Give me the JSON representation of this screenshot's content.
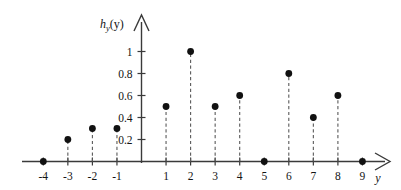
{
  "figure": {
    "title": "",
    "y_axis_label": "h",
    "y_axis_label_sub": "y",
    "y_axis_label_arg": "(y)",
    "x_axis_label": "y"
  },
  "chart_data": {
    "type": "stem",
    "title": "",
    "xlabel": "y",
    "ylabel": "h_y(y)",
    "x": [
      -4,
      -3,
      -2,
      -1,
      1,
      2,
      3,
      4,
      5,
      6,
      7,
      8,
      9
    ],
    "values": [
      0,
      0.2,
      0.3,
      0.3,
      0.5,
      1,
      0.5,
      0.6,
      0,
      0.8,
      0.4,
      0.6,
      0
    ],
    "points": [
      {
        "x": -4,
        "y": 0
      },
      {
        "x": -3,
        "y": 0.2
      },
      {
        "x": -2,
        "y": 0.3
      },
      {
        "x": -1,
        "y": 0.3
      },
      {
        "x": 1,
        "y": 0.5
      },
      {
        "x": 2,
        "y": 1
      },
      {
        "x": 3,
        "y": 0.5
      },
      {
        "x": 4,
        "y": 0.6
      },
      {
        "x": 5,
        "y": 0
      },
      {
        "x": 6,
        "y": 0.8
      },
      {
        "x": 7,
        "y": 0.4
      },
      {
        "x": 8,
        "y": 0.6
      },
      {
        "x": 9,
        "y": 0
      }
    ],
    "xticks": [
      -4,
      -3,
      -2,
      -1,
      1,
      2,
      3,
      4,
      5,
      6,
      7,
      8,
      9
    ],
    "xtick_labels": [
      "-4",
      "-3",
      "-2",
      "-1",
      "1",
      "2",
      "3",
      "4",
      "5",
      "6",
      "7",
      "8",
      "9"
    ],
    "yticks": [
      0.2,
      0.4,
      0.6,
      0.8,
      1
    ],
    "ytick_labels": [
      "0.2",
      "0.4",
      "0.6",
      "0.8",
      "1"
    ],
    "xlim": [
      -4.8,
      9.9
    ],
    "ylim": [
      0,
      1.12
    ],
    "grid": false,
    "legend": null,
    "marker_color": "#111111",
    "stem_color": "#5a5a5a",
    "axis_color": "#3a3a3a",
    "stem_style": "dashed"
  }
}
